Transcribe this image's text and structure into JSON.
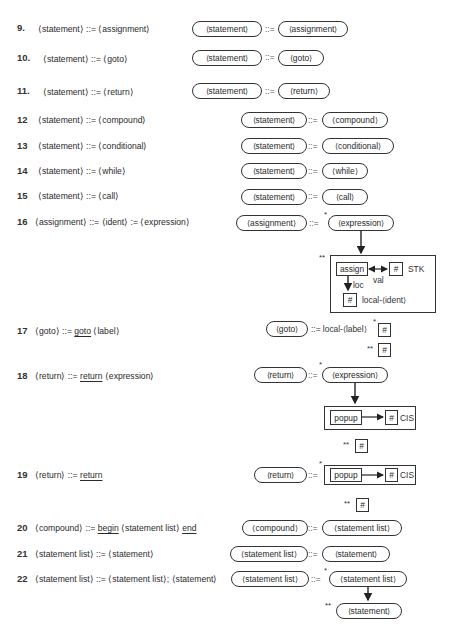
{
  "rules": [
    {
      "num": "9.",
      "text": "⟨statement⟩ ::= ⟨assignment⟩"
    },
    {
      "num": "10.",
      "text": "⟨statement⟩ ::= ⟨goto⟩"
    },
    {
      "num": "11.",
      "text": "⟨statement⟩ ::= ⟨return⟩"
    },
    {
      "num": "12",
      "text": "⟨statement⟩ ::= ⟨compound⟩"
    },
    {
      "num": "13",
      "text": "⟨statement⟩ ::= ⟨conditional⟩"
    },
    {
      "num": "14",
      "text": "⟨statement⟩ ::= ⟨while⟩"
    },
    {
      "num": "15",
      "text": "⟨statement⟩ ::= ⟨call⟩"
    },
    {
      "num": "16",
      "text": "⟨assignment⟩ ::= ⟨ident⟩ := ⟨expression⟩"
    },
    {
      "num": "17",
      "pre": "⟨goto⟩ ::= ",
      "kw": "goto",
      "post": " ⟨label⟩"
    },
    {
      "num": "18",
      "pre": "⟨return⟩ ::= ",
      "kw": "return",
      "post": " ⟨expression⟩"
    },
    {
      "num": "19",
      "pre": "⟨return⟩ ::= ",
      "kw": "return",
      "post": ""
    },
    {
      "num": "20",
      "pre": "⟨compound⟩ ::= ",
      "kw": "begin",
      "mid": " ⟨statement list⟩ ",
      "kw2": "end"
    },
    {
      "num": "21",
      "text": "⟨statement list⟩ ::= ⟨statement⟩"
    },
    {
      "num": "22",
      "text": "⟨statement list⟩ ::= ⟨statement list⟩; ⟨statement⟩"
    }
  ],
  "op": "::=",
  "star": "*",
  "dstar": "**",
  "hash": "#",
  "diagrams": {
    "d9": {
      "lhs": "⟨statement⟩",
      "rhs": "⟨assignment⟩"
    },
    "d10": {
      "lhs": "⟨statement⟩",
      "rhs": "⟨goto⟩"
    },
    "d11": {
      "lhs": "⟨statement⟩",
      "rhs": "⟨return⟩"
    },
    "d12": {
      "lhs": "⟨statement⟩",
      "rhs": "⟨compound⟩"
    },
    "d13": {
      "lhs": "⟨statement⟩",
      "rhs": "⟨conditional⟩"
    },
    "d14": {
      "lhs": "⟨statement⟩",
      "rhs": "⟨while⟩"
    },
    "d15": {
      "lhs": "⟨statement⟩",
      "rhs": "⟨call⟩"
    },
    "d16": {
      "lhs": "⟨assignment⟩",
      "rhs": "⟨expression⟩",
      "assign": "assign",
      "val": "val",
      "loc": "loc",
      "stk": "STK",
      "local": "local-⟨ident⟩"
    },
    "d17": {
      "lhs": "⟨goto⟩",
      "rhs": "::= local-⟨label⟩"
    },
    "d18": {
      "lhs": "⟨return⟩",
      "rhs": "⟨expression⟩",
      "popup": "popup",
      "cis": "CIS"
    },
    "d19": {
      "lhs": "⟨return⟩",
      "popup": "popup",
      "cis": "CIS"
    },
    "d20": {
      "lhs": "⟨compound⟩",
      "rhs": "⟨statement list⟩"
    },
    "d21": {
      "lhs": "⟨statement list⟩",
      "rhs": "⟨statement⟩"
    },
    "d22": {
      "lhs": "⟨statement list⟩",
      "rhs": "⟨statement list⟩",
      "rhs2": "⟨statement⟩"
    }
  }
}
